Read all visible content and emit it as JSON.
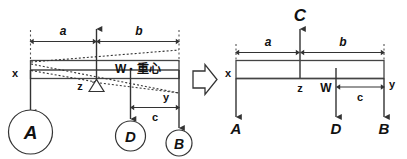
{
  "figure": {
    "colors": {
      "stroke": "#333333",
      "text": "#111111",
      "background": "#ffffff"
    },
    "transition_icon": "right-arrow-icon"
  },
  "left_diagram": {
    "name": "Balanced beam with fulcrum",
    "dimensions": [
      {
        "id": "a",
        "label": "a"
      },
      {
        "id": "b",
        "label": "b"
      },
      {
        "id": "c",
        "label": "c"
      }
    ],
    "point_labels": [
      {
        "id": "x",
        "label": "x"
      },
      {
        "id": "z",
        "label": "z"
      },
      {
        "id": "y",
        "label": "y"
      }
    ],
    "load_label": "W",
    "load_separator": "・",
    "center_of_gravity": "重心",
    "nodes": [
      {
        "id": "A",
        "label": "A"
      },
      {
        "id": "D",
        "label": "D"
      },
      {
        "id": "B",
        "label": "B"
      }
    ],
    "fulcrum": "triangle-fulcrum-icon",
    "up_force": "up-arrow-icon"
  },
  "right_diagram": {
    "name": "Free body diagram with reaction C",
    "reaction_label": "C",
    "dimensions": [
      {
        "id": "a",
        "label": "a"
      },
      {
        "id": "b",
        "label": "b"
      },
      {
        "id": "c",
        "label": "c"
      }
    ],
    "point_labels": [
      {
        "id": "x",
        "label": "x"
      },
      {
        "id": "z",
        "label": "z"
      },
      {
        "id": "y",
        "label": "y"
      }
    ],
    "load_label": "W",
    "nodes": [
      {
        "id": "A",
        "label": "A"
      },
      {
        "id": "D",
        "label": "D"
      },
      {
        "id": "B",
        "label": "B"
      }
    ]
  }
}
